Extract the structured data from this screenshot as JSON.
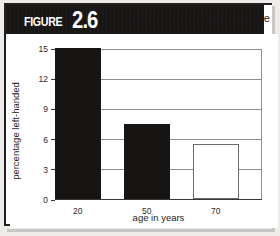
{
  "figure": {
    "label_word": "FIGURE",
    "number": "2.6",
    "title": "Handedness as a function of age"
  },
  "colors": {
    "banner": "#181615",
    "bar_filled": "#171514",
    "bar_hollow_border": "#6e6c69",
    "gridline": "#8f8d8a",
    "axis": "#3a3836",
    "frame": "#221f1e"
  },
  "chart_data": {
    "type": "bar",
    "title": "Handedness as a function of age",
    "categories": [
      "20",
      "50",
      "70"
    ],
    "values": [
      15,
      7.5,
      5.5
    ],
    "bar_styles": [
      "filled",
      "filled",
      "hollow"
    ],
    "xlabel": "age in years",
    "ylabel": "percentage left-handed",
    "ylim": [
      0,
      15
    ],
    "yticks": [
      0,
      3,
      6,
      9,
      12,
      15
    ],
    "ytick_labels": [
      "0",
      "3",
      "6",
      "9",
      "12",
      "15"
    ],
    "grid": true,
    "legend": null
  }
}
